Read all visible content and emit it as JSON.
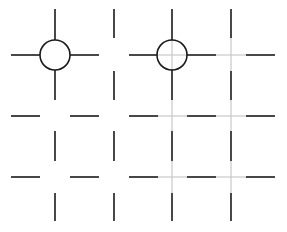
{
  "diagram": {
    "width": 287,
    "height": 232,
    "colors": {
      "background": "#ffffff",
      "dark_line": "#1a1a1a",
      "gray_connector": "#c8c8c8"
    },
    "stroke_width": 1.6,
    "columns_x": [
      55,
      114,
      172,
      231
    ],
    "rows_y": [
      55,
      116,
      177
    ],
    "horizontal_segments": [
      {
        "y": 55,
        "x1": 11,
        "x2": 40,
        "style": "dark"
      },
      {
        "y": 55,
        "x1": 70,
        "x2": 99,
        "style": "dark"
      },
      {
        "y": 55,
        "x1": 129,
        "x2": 157,
        "style": "dark"
      },
      {
        "y": 55,
        "x1": 187,
        "x2": 216,
        "style": "dark"
      },
      {
        "y": 55,
        "x1": 246,
        "x2": 275,
        "style": "dark"
      },
      {
        "y": 116,
        "x1": 11,
        "x2": 40,
        "style": "dark"
      },
      {
        "y": 116,
        "x1": 70,
        "x2": 99,
        "style": "dark"
      },
      {
        "y": 116,
        "x1": 129,
        "x2": 158,
        "style": "dark"
      },
      {
        "y": 116,
        "x1": 187,
        "x2": 216,
        "style": "dark"
      },
      {
        "y": 116,
        "x1": 246,
        "x2": 275,
        "style": "dark"
      },
      {
        "y": 177,
        "x1": 11,
        "x2": 40,
        "style": "dark"
      },
      {
        "y": 177,
        "x1": 70,
        "x2": 99,
        "style": "dark"
      },
      {
        "y": 177,
        "x1": 129,
        "x2": 158,
        "style": "dark"
      },
      {
        "y": 177,
        "x1": 187,
        "x2": 216,
        "style": "dark"
      },
      {
        "y": 177,
        "x1": 246,
        "x2": 275,
        "style": "dark"
      },
      {
        "y": 55,
        "x1": 157,
        "x2": 187,
        "style": "gray"
      },
      {
        "y": 55,
        "x1": 216,
        "x2": 246,
        "style": "gray"
      },
      {
        "y": 116,
        "x1": 158,
        "x2": 187,
        "style": "gray"
      },
      {
        "y": 116,
        "x1": 216,
        "x2": 246,
        "style": "gray"
      },
      {
        "y": 177,
        "x1": 158,
        "x2": 187,
        "style": "gray"
      },
      {
        "y": 177,
        "x1": 216,
        "x2": 246,
        "style": "gray"
      }
    ],
    "vertical_segments": [
      {
        "x": 55,
        "y1": 9,
        "y2": 40,
        "style": "dark"
      },
      {
        "x": 55,
        "y1": 70,
        "y2": 100,
        "style": "dark"
      },
      {
        "x": 55,
        "y1": 131,
        "y2": 161,
        "style": "dark"
      },
      {
        "x": 55,
        "y1": 193,
        "y2": 221,
        "style": "dark"
      },
      {
        "x": 114,
        "y1": 9,
        "y2": 38,
        "style": "dark"
      },
      {
        "x": 114,
        "y1": 71,
        "y2": 100,
        "style": "dark"
      },
      {
        "x": 114,
        "y1": 131,
        "y2": 161,
        "style": "dark"
      },
      {
        "x": 114,
        "y1": 193,
        "y2": 221,
        "style": "dark"
      },
      {
        "x": 172,
        "y1": 9,
        "y2": 40,
        "style": "dark"
      },
      {
        "x": 172,
        "y1": 70,
        "y2": 100,
        "style": "dark"
      },
      {
        "x": 172,
        "y1": 131,
        "y2": 161,
        "style": "dark"
      },
      {
        "x": 172,
        "y1": 193,
        "y2": 221,
        "style": "dark"
      },
      {
        "x": 231,
        "y1": 9,
        "y2": 38,
        "style": "dark"
      },
      {
        "x": 231,
        "y1": 71,
        "y2": 100,
        "style": "dark"
      },
      {
        "x": 231,
        "y1": 131,
        "y2": 161,
        "style": "dark"
      },
      {
        "x": 231,
        "y1": 193,
        "y2": 221,
        "style": "dark"
      },
      {
        "x": 172,
        "y1": 40,
        "y2": 70,
        "style": "gray"
      },
      {
        "x": 172,
        "y1": 100,
        "y2": 131,
        "style": "gray"
      },
      {
        "x": 172,
        "y1": 161,
        "y2": 193,
        "style": "gray"
      },
      {
        "x": 231,
        "y1": 38,
        "y2": 71,
        "style": "gray"
      },
      {
        "x": 231,
        "y1": 100,
        "y2": 131,
        "style": "gray"
      },
      {
        "x": 231,
        "y1": 161,
        "y2": 193,
        "style": "gray"
      }
    ],
    "circles": [
      {
        "name": "left-junction-circle",
        "cx": 55,
        "cy": 55,
        "r": 15
      },
      {
        "name": "right-junction-circle",
        "cx": 172,
        "cy": 55,
        "r": 15
      }
    ]
  }
}
